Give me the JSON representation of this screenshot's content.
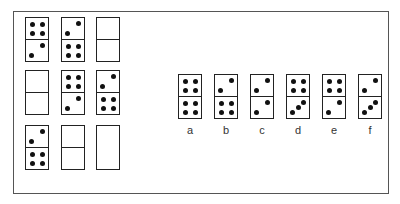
{
  "puzzle": {
    "grid": [
      {
        "id": "r1c1",
        "top": 4,
        "bottom": 2,
        "divider": true
      },
      {
        "id": "r1c2",
        "top": 2,
        "bottom": 4,
        "divider": true
      },
      {
        "id": "r1c3",
        "top": 0,
        "bottom": 0,
        "divider": true
      },
      {
        "id": "r2c1",
        "top": 0,
        "bottom": 0,
        "divider": true
      },
      {
        "id": "r2c2",
        "top": 4,
        "bottom": 2,
        "divider": true
      },
      {
        "id": "r2c3",
        "top": 2,
        "bottom": 4,
        "divider": true
      },
      {
        "id": "r3c1",
        "top": 2,
        "bottom": 4,
        "divider": true
      },
      {
        "id": "r3c2",
        "top": 0,
        "bottom": 0,
        "divider": true
      },
      {
        "id": "r3c3",
        "top": 0,
        "bottom": 0,
        "divider": false
      }
    ],
    "options": [
      {
        "label": "a",
        "top": 4,
        "bottom": 4
      },
      {
        "label": "b",
        "top": 2,
        "bottom": 4
      },
      {
        "label": "c",
        "top": 2,
        "bottom": 2
      },
      {
        "label": "d",
        "top": 4,
        "bottom": 3
      },
      {
        "label": "e",
        "top": 4,
        "bottom": 2
      },
      {
        "label": "f",
        "top": 2,
        "bottom": 3
      }
    ]
  }
}
